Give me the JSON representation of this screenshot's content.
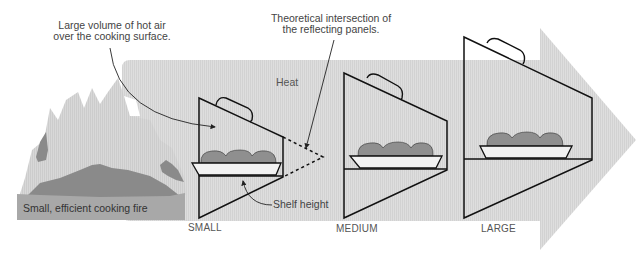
{
  "diagram": {
    "colors": {
      "heat_arrow": "#dcdcdc",
      "fire_light": "#d4d4d4",
      "fire_dark": "#8a8a8a",
      "fire_base": "#a7a7a7",
      "bread": "#8f8f8f",
      "stroke": "#111111",
      "text": "#444444"
    },
    "labels": {
      "hot_air_callout_line1": "Large volume of hot air",
      "hot_air_callout_line2": "over the cooking surface.",
      "intersection_callout_line1": "Theoretical intersection of",
      "intersection_callout_line2": "the reflecting panels.",
      "heat": "Heat",
      "shelf_height": "Shelf height",
      "fire_caption": "Small, efficient cooking fire"
    },
    "ovens": [
      {
        "size": "SMALL",
        "left_x": 199,
        "top_y": 98,
        "bottom_y": 218,
        "right_x": 283,
        "right_top_y": 137,
        "shelf_y": 176
      },
      {
        "size": "MEDIUM",
        "left_x": 344,
        "top_y": 73,
        "bottom_y": 218,
        "right_x": 447,
        "right_top_y": 121,
        "shelf_y": 169
      },
      {
        "size": "LARGE",
        "left_x": 464,
        "top_y": 37,
        "bottom_y": 218,
        "right_x": 592,
        "right_top_y": 98,
        "shelf_y": 159
      }
    ],
    "size_labels": [
      "SMALL",
      "MEDIUM",
      "LARGE"
    ],
    "icons": {
      "heat_arrow": "right-arrow-icon",
      "fire": "fire-icon",
      "bread": "bread-loaf-icon",
      "handle": "handle-icon"
    }
  }
}
